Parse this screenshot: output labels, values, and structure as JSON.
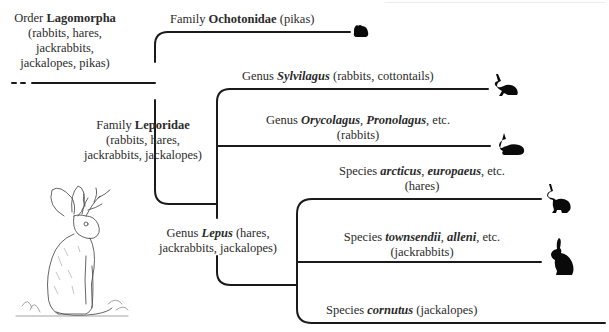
{
  "colors": {
    "line": "#1a1a1a",
    "text": "#2b2b2b",
    "silhouette": "#0a0a0a"
  },
  "nodes": {
    "order": {
      "rank": "Order",
      "name": "Lagomorpha",
      "common_1": "(rabbits, hares,",
      "common_2": "jackrabbits,",
      "common_3": "jackalopes, pikas)"
    },
    "ochotonidae": {
      "rank": "Family",
      "name": "Ochotonidae",
      "common": "(pikas)",
      "icon": "pika-silhouette-icon"
    },
    "leporidae": {
      "rank": "Family",
      "name": "Leporidae",
      "common_1": "(rabbits, hares,",
      "common_2": "jackrabbits, jackalopes)"
    },
    "sylvilagus": {
      "rank": "Genus",
      "name": "Sylvilagus",
      "common": "(rabbits, cottontails)",
      "icon": "cottontail-silhouette-icon"
    },
    "orycolagus": {
      "rank": "Genus",
      "name_1": "Orycolagus",
      "sep": ",",
      "name_2": "Pronolagus",
      "suffix": ", etc.",
      "common": "(rabbits)",
      "icon": "rabbit-silhouette-icon"
    },
    "lepus": {
      "rank": "Genus",
      "name": "Lepus",
      "common_1": "(hares,",
      "common_2": "jackrabbits, jackalopes)"
    },
    "arcticus": {
      "rank": "Species",
      "name_1": "arcticus",
      "sep": ",",
      "name_2": "europaeus",
      "suffix": ", etc.",
      "common": "(hares)",
      "icon": "hare-silhouette-icon"
    },
    "townsendii": {
      "rank": "Species",
      "name_1": "townsendii",
      "sep": ",",
      "name_2": "alleni",
      "suffix": ", etc.",
      "common": "(jackrabbits)",
      "icon": "jackrabbit-silhouette-icon"
    },
    "cornutus": {
      "rank": "Species",
      "name": "cornutus",
      "common": "(jackalopes)"
    }
  },
  "illustration": "jackalope-sketch"
}
